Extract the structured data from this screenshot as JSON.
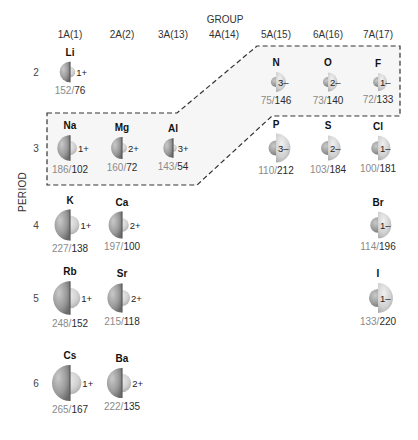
{
  "title": "GROUP",
  "period_label": "PERIOD",
  "groups": [
    {
      "label": "1A(1)",
      "x": 70
    },
    {
      "label": "2A(2)",
      "x": 122
    },
    {
      "label": "3A(13)",
      "x": 173
    },
    {
      "label": "4A(14)",
      "x": 224
    },
    {
      "label": "5A(15)",
      "x": 276
    },
    {
      "label": "6A(16)",
      "x": 328
    },
    {
      "label": "7A(17)",
      "x": 378
    }
  ],
  "periods": [
    {
      "label": "2",
      "y": 72
    },
    {
      "label": "3",
      "y": 148
    },
    {
      "label": "4",
      "y": 225
    },
    {
      "label": "5",
      "y": 298
    },
    {
      "label": "6",
      "y": 383
    }
  ],
  "elements": [
    {
      "symbol": "Li",
      "charge": "1+",
      "atomic_radius": "152",
      "ionic_radius": "76",
      "type": "cation",
      "x": 70,
      "y": 72
    },
    {
      "symbol": "Na",
      "charge": "1+",
      "atomic_radius": "186",
      "ionic_radius": "102",
      "type": "cation",
      "x": 70,
      "y": 148
    },
    {
      "symbol": "Mg",
      "charge": "2+",
      "atomic_radius": "160",
      "ionic_radius": "72",
      "type": "cation",
      "x": 122,
      "y": 148
    },
    {
      "symbol": "Al",
      "charge": "3+",
      "atomic_radius": "143",
      "ionic_radius": "54",
      "type": "cation",
      "x": 173,
      "y": 148
    },
    {
      "symbol": "N",
      "charge": "3–",
      "atomic_radius": "75",
      "ionic_radius": "146",
      "type": "anion",
      "x": 276,
      "y": 82
    },
    {
      "symbol": "O",
      "charge": "2–",
      "atomic_radius": "73",
      "ionic_radius": "140",
      "type": "anion",
      "x": 328,
      "y": 82
    },
    {
      "symbol": "F",
      "charge": "1–",
      "atomic_radius": "72",
      "ionic_radius": "133",
      "type": "anion",
      "x": 378,
      "y": 82
    },
    {
      "symbol": "P",
      "charge": "3–",
      "atomic_radius": "110",
      "ionic_radius": "212",
      "type": "anion",
      "x": 276,
      "y": 148
    },
    {
      "symbol": "S",
      "charge": "2–",
      "atomic_radius": "103",
      "ionic_radius": "184",
      "type": "anion",
      "x": 328,
      "y": 148
    },
    {
      "symbol": "Cl",
      "charge": "1–",
      "atomic_radius": "100",
      "ionic_radius": "181",
      "type": "anion",
      "x": 378,
      "y": 148
    },
    {
      "symbol": "K",
      "charge": "1+",
      "atomic_radius": "227",
      "ionic_radius": "138",
      "type": "cation",
      "x": 70,
      "y": 225
    },
    {
      "symbol": "Ca",
      "charge": "2+",
      "atomic_radius": "197",
      "ionic_radius": "100",
      "type": "cation",
      "x": 122,
      "y": 225
    },
    {
      "symbol": "Br",
      "charge": "1–",
      "atomic_radius": "114",
      "ionic_radius": "196",
      "type": "anion",
      "x": 378,
      "y": 225
    },
    {
      "symbol": "Rb",
      "charge": "1+",
      "atomic_radius": "248",
      "ionic_radius": "152",
      "type": "cation",
      "x": 70,
      "y": 298
    },
    {
      "symbol": "Sr",
      "charge": "2+",
      "atomic_radius": "215",
      "ionic_radius": "118",
      "type": "cation",
      "x": 122,
      "y": 298
    },
    {
      "symbol": "I",
      "charge": "1–",
      "atomic_radius": "133",
      "ionic_radius": "220",
      "type": "anion",
      "x": 378,
      "y": 298
    },
    {
      "symbol": "Cs",
      "charge": "1+",
      "atomic_radius": "265",
      "ionic_radius": "167",
      "type": "cation",
      "x": 70,
      "y": 383
    },
    {
      "symbol": "Ba",
      "charge": "2+",
      "atomic_radius": "222",
      "ionic_radius": "135",
      "type": "cation",
      "x": 122,
      "y": 383
    }
  ],
  "highlight_region": {
    "points": "47,113 177,113 257,46 400,46 400,116 272,116 197,185 47,185"
  },
  "colors": {
    "atom_dark": "#7d7d7d",
    "atom_light": "#b9b9b9",
    "ion_light": "#d4d4d4",
    "region_fill": "#f6f6f6",
    "dash": "#333333"
  }
}
